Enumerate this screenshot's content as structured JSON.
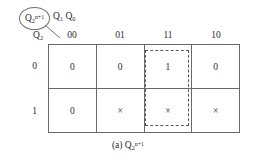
{
  "figure": {
    "annotation": {
      "label_base": "Q",
      "label_sub": "2",
      "label_sup": "n+1",
      "circled": "true"
    },
    "column_variable": {
      "base1": "Q",
      "sub1": "1",
      "base2": "Q",
      "sub2": "0"
    },
    "row_variable": {
      "base": "Q",
      "sub": "2"
    },
    "column_headers": [
      "00",
      "01",
      "11",
      "10"
    ],
    "row_headers": [
      "0",
      "1"
    ],
    "rows": [
      {
        "label": "0",
        "cells": [
          "0",
          "0",
          "1",
          "0"
        ]
      },
      {
        "label": "1",
        "cells": [
          "0",
          "×",
          "×",
          "×"
        ]
      }
    ],
    "grouping": {
      "column_index": 2,
      "style": "dashed",
      "spans_rows": "0-1"
    },
    "caption": {
      "prefix": "(a) ",
      "base": "Q",
      "sub": "2",
      "sup": "n+1"
    },
    "colors": {
      "grid_line": "#6a6a6a",
      "dashed_group": "#5a5a5a",
      "text": "#2b2b2b",
      "background": "#ffffff"
    }
  }
}
